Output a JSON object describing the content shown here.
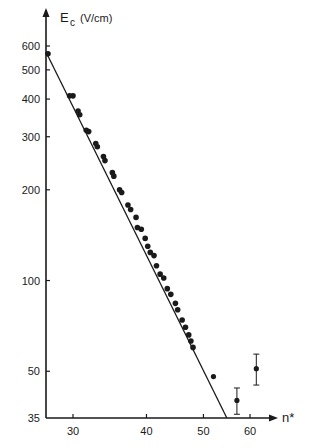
{
  "chart_data": {
    "type": "scatter",
    "title": "",
    "xlabel": "n*",
    "ylabel": "E_c (V/cm)",
    "ylabel_main": "E",
    "ylabel_sub": "c",
    "ylabel_unit": "(V/cm)",
    "x_scale": "log",
    "y_scale": "log",
    "xlim": [
      27,
      65
    ],
    "ylim": [
      35,
      650
    ],
    "grid": false,
    "legend": null,
    "x_ticks": [
      30,
      40,
      50,
      60
    ],
    "x_tick_labels": [
      "30",
      "40",
      "50",
      "60"
    ],
    "y_ticks": [
      600,
      500,
      400,
      300,
      200,
      100,
      50,
      35
    ],
    "y_tick_labels": [
      "600",
      "500",
      "400",
      "300",
      "200",
      "100",
      "50",
      "35"
    ],
    "series": [
      {
        "name": "measured",
        "marker": "filled-circle",
        "points": [
          {
            "x": 27.2,
            "y": 565
          },
          {
            "x": 29.6,
            "y": 410
          },
          {
            "x": 30.0,
            "y": 410
          },
          {
            "x": 30.6,
            "y": 365
          },
          {
            "x": 30.8,
            "y": 355
          },
          {
            "x": 31.6,
            "y": 315
          },
          {
            "x": 31.9,
            "y": 312
          },
          {
            "x": 32.8,
            "y": 285
          },
          {
            "x": 33.0,
            "y": 278
          },
          {
            "x": 33.8,
            "y": 258
          },
          {
            "x": 34.0,
            "y": 250
          },
          {
            "x": 35.0,
            "y": 228
          },
          {
            "x": 35.2,
            "y": 222
          },
          {
            "x": 36.0,
            "y": 200
          },
          {
            "x": 36.3,
            "y": 196
          },
          {
            "x": 37.2,
            "y": 178
          },
          {
            "x": 37.6,
            "y": 172
          },
          {
            "x": 38.4,
            "y": 162
          },
          {
            "x": 38.6,
            "y": 150
          },
          {
            "x": 39.2,
            "y": 148
          },
          {
            "x": 39.8,
            "y": 138
          },
          {
            "x": 40.2,
            "y": 130
          },
          {
            "x": 40.6,
            "y": 124
          },
          {
            "x": 41.2,
            "y": 121
          },
          {
            "x": 41.6,
            "y": 112
          },
          {
            "x": 42.2,
            "y": 105
          },
          {
            "x": 42.8,
            "y": 102
          },
          {
            "x": 43.4,
            "y": 94
          },
          {
            "x": 44.0,
            "y": 90
          },
          {
            "x": 44.8,
            "y": 84
          },
          {
            "x": 45.2,
            "y": 80
          },
          {
            "x": 46.0,
            "y": 74
          },
          {
            "x": 46.6,
            "y": 70
          },
          {
            "x": 47.2,
            "y": 66
          },
          {
            "x": 47.6,
            "y": 63
          },
          {
            "x": 48.0,
            "y": 60
          }
        ]
      },
      {
        "name": "outliers",
        "marker": "filled-circle",
        "points": [
          {
            "x": 52.0,
            "y": 48
          },
          {
            "x": 57.0,
            "y": 40,
            "y_err_low": 36,
            "y_err_high": 44
          },
          {
            "x": 61.5,
            "y": 51,
            "y_err_low": 45,
            "y_err_high": 57
          }
        ]
      }
    ],
    "fit_line": {
      "x": [
        27.0,
        54.8
      ],
      "y": [
        572,
        35
      ]
    }
  }
}
